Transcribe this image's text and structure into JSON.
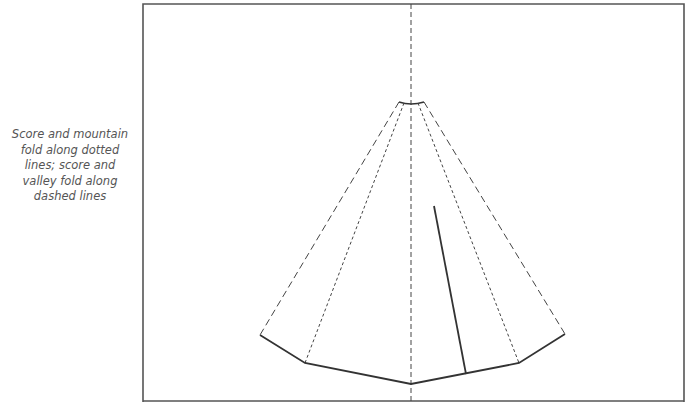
{
  "caption": {
    "lines": [
      "Score and mountain",
      "fold along dotted",
      "lines; score and",
      "valley fold along",
      "dashed lines"
    ]
  },
  "legend": {
    "dotted": "mountain fold",
    "dashed": "valley fold"
  },
  "colors": {
    "frame": "#555555",
    "lines": "#333333",
    "text": "#555555",
    "background": "#ffffff"
  }
}
